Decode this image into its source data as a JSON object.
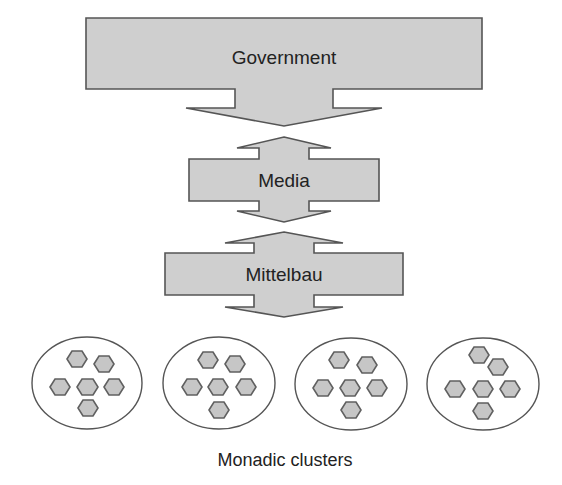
{
  "diagram": {
    "layers": [
      {
        "id": "government",
        "label": "Government"
      },
      {
        "id": "media",
        "label": "Media"
      },
      {
        "id": "mittelbau",
        "label": "Mittelbau"
      }
    ],
    "caption": "Monadic clusters",
    "cluster_count": 4,
    "hexagons_per_cluster": 6,
    "colors": {
      "box_fill": "#cfcfcf",
      "outline": "#555555",
      "hex_fill": "#c6c6c6",
      "text": "#222222"
    }
  }
}
